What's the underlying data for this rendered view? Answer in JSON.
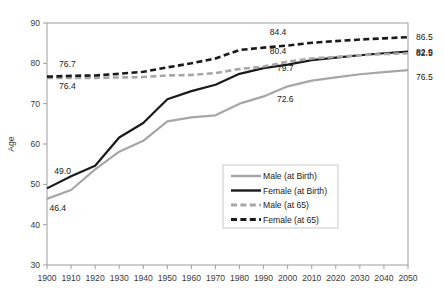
{
  "chart_data": {
    "type": "line",
    "title": "",
    "xlabel": "",
    "ylabel": "Age",
    "xlim": [
      1900,
      2050
    ],
    "ylim": [
      30,
      90
    ],
    "yticks": [
      30,
      40,
      50,
      60,
      70,
      80,
      90
    ],
    "grid": false,
    "legend_position": "inside-bottom-right",
    "x": [
      1900,
      1910,
      1920,
      1930,
      1940,
      1950,
      1960,
      1970,
      1980,
      1990,
      2000,
      2010,
      2020,
      2030,
      2040,
      2050
    ],
    "categories": [
      "1900",
      "1910",
      "1920",
      "1930",
      "1940",
      "1950",
      "1960",
      "1970",
      "1980",
      "1990",
      "2000",
      "2010",
      "2020",
      "2030",
      "2040",
      "2050"
    ],
    "series": [
      {
        "name": "Male (at Birth)",
        "style": "solid",
        "color": "#a6a6a6",
        "values": [
          46.4,
          48.6,
          53.7,
          58.1,
          60.8,
          65.6,
          66.6,
          67.1,
          70.0,
          71.8,
          74.3,
          75.7,
          76.5,
          77.3,
          77.8,
          78.3
        ]
      },
      {
        "name": "Female (at Birth)",
        "style": "solid",
        "color": "#1a1a1a",
        "values": [
          49.0,
          52.0,
          54.6,
          61.6,
          65.2,
          71.1,
          73.1,
          74.7,
          77.4,
          78.8,
          79.7,
          80.8,
          81.4,
          82.0,
          82.5,
          82.9
        ]
      },
      {
        "name": "Male (at 65)",
        "style": "dashed",
        "color": "#a6a6a6",
        "values": [
          76.4,
          76.4,
          76.4,
          76.5,
          76.6,
          77.0,
          77.1,
          77.6,
          78.6,
          79.2,
          80.4,
          81.2,
          81.6,
          82.0,
          82.3,
          82.5
        ]
      },
      {
        "name": "Female (at 65)",
        "style": "dashed",
        "color": "#1a1a1a",
        "values": [
          76.7,
          76.9,
          77.0,
          77.4,
          77.9,
          79.0,
          80.0,
          81.2,
          83.3,
          83.9,
          84.4,
          85.1,
          85.5,
          85.9,
          86.2,
          86.5
        ]
      }
    ],
    "annotations": [
      {
        "text": "76.7",
        "x": 1905,
        "y": 79.2,
        "anchor": "start"
      },
      {
        "text": "76.4",
        "x": 1905,
        "y": 73.6,
        "anchor": "start"
      },
      {
        "text": "49.0",
        "x": 1903,
        "y": 52.6,
        "anchor": "start"
      },
      {
        "text": "46.4",
        "x": 1901,
        "y": 43.3,
        "anchor": "start"
      },
      {
        "text": "84.4",
        "x": 1996,
        "y": 87.0,
        "anchor": "middle"
      },
      {
        "text": "80.4",
        "x": 1996,
        "y": 82.4,
        "anchor": "middle"
      },
      {
        "text": "79.7",
        "x": 1999,
        "y": 78.0,
        "anchor": "middle"
      },
      {
        "text": "72.6",
        "x": 1999,
        "y": 70.3,
        "anchor": "middle"
      }
    ],
    "end_labels": [
      {
        "text": "86.5",
        "value": 86.5,
        "series": "Female (at 65)"
      },
      {
        "text": "82.5",
        "value": 82.5,
        "series": "Male (at 65)"
      },
      {
        "text": "82.9",
        "value": 82.9,
        "series": "Female (at Birth)"
      },
      {
        "text": "76.5",
        "value": 76.5,
        "series": "Male (at Birth)"
      }
    ],
    "legend": [
      {
        "label": "Male (at Birth)",
        "style": "solid",
        "color": "#a6a6a6"
      },
      {
        "label": "Female (at Birth)",
        "style": "solid",
        "color": "#1a1a1a"
      },
      {
        "label": "Male (at 65)",
        "style": "dashed",
        "color": "#a6a6a6"
      },
      {
        "label": "Female (at 65)",
        "style": "dashed",
        "color": "#1a1a1a"
      }
    ]
  },
  "axis": {
    "y_title": "Age",
    "y_tick_labels": [
      "90",
      "80",
      "70",
      "60",
      "50",
      "40",
      "30"
    ],
    "x_tick_labels": [
      "1900",
      "1910",
      "1920",
      "1930",
      "1940",
      "1950",
      "1960",
      "1970",
      "1980",
      "1990",
      "2000",
      "2010",
      "2020",
      "2030",
      "2040",
      "2050"
    ]
  },
  "colors": {
    "grey_series": "#a6a6a6",
    "black_series": "#1a1a1a",
    "axis_line": "#9d9d9d",
    "background": "#ffffff"
  }
}
